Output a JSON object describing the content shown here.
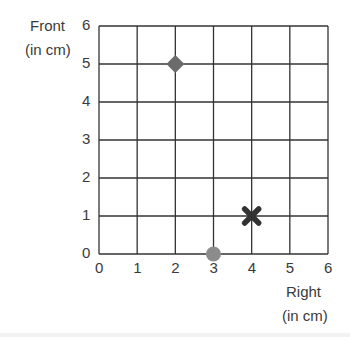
{
  "chart_data": {
    "type": "scatter",
    "title": "",
    "ylabel": "Front (in cm)",
    "ylabel_lines": [
      "Front",
      "(in cm)"
    ],
    "xlabel": "Right (in cm)",
    "xlabel_lines": [
      "Right",
      "(in cm)"
    ],
    "xlim": [
      0,
      6
    ],
    "ylim": [
      0,
      6
    ],
    "x_ticks": [
      "0",
      "1",
      "2",
      "3",
      "4",
      "5",
      "6"
    ],
    "y_ticks": [
      "0",
      "1",
      "2",
      "3",
      "4",
      "5",
      "6"
    ],
    "grid": true,
    "legend": null,
    "points": [
      {
        "x": 2,
        "y": 5,
        "marker": "diamond",
        "color": "#6b6b6b"
      },
      {
        "x": 4,
        "y": 1,
        "marker": "x-cross",
        "color": "#333333"
      },
      {
        "x": 3,
        "y": 0,
        "marker": "circle",
        "color": "#8c8c8c"
      }
    ]
  },
  "colors": {
    "grid": "#333333",
    "text": "#3a3a3a"
  }
}
